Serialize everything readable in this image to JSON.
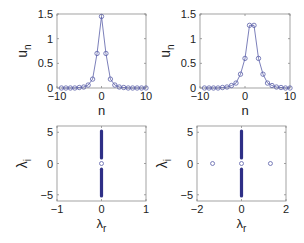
{
  "figure": {
    "background": "#ffffff",
    "line_color": "#5a5fa8",
    "marker_color": "#5a5fa8",
    "eig_color": "#2e2f86",
    "axis_color": "#8c8c8c"
  },
  "chart_data": [
    {
      "id": "top-left",
      "type": "line",
      "title": "",
      "xlabel": "n",
      "ylabel": "u",
      "ylabel_sub": "n",
      "xlim": [
        -10,
        10
      ],
      "ylim": [
        0,
        1.5
      ],
      "xticks": [
        "-10",
        "0",
        "10"
      ],
      "xtick_values": [
        -10,
        0,
        10
      ],
      "yticks": [
        "0",
        "0.5",
        "1",
        "1.5"
      ],
      "ytick_values": [
        0,
        0.5,
        1,
        1.5
      ],
      "grid": false,
      "frame": {
        "x0": 57,
        "x1": 146,
        "y0": 14,
        "y1": 88
      },
      "series": [
        {
          "name": "u_n",
          "marker": "circle-open",
          "x": [
            -9,
            -8,
            -7,
            -6,
            -5,
            -4,
            -3,
            -2,
            -1,
            0,
            1,
            2,
            3,
            4,
            5,
            6,
            7,
            8,
            9,
            10
          ],
          "values": [
            0.0,
            0.0,
            0.0,
            0.0,
            0.01,
            0.02,
            0.06,
            0.18,
            0.7,
            1.45,
            0.7,
            0.18,
            0.06,
            0.02,
            0.01,
            0.0,
            0.0,
            0.0,
            0.0,
            0.0
          ]
        }
      ]
    },
    {
      "id": "top-right",
      "type": "line",
      "title": "",
      "xlabel": "n",
      "ylabel": "u",
      "ylabel_sub": "n",
      "xlim": [
        -10,
        10
      ],
      "ylim": [
        0,
        1.5
      ],
      "xticks": [
        "-10",
        "0",
        "10"
      ],
      "xtick_values": [
        -10,
        0,
        10
      ],
      "yticks": [
        "0",
        "0.5",
        "1",
        "1.5"
      ],
      "ytick_values": [
        0,
        0.5,
        1,
        1.5
      ],
      "grid": false,
      "frame": {
        "x0": 200,
        "x1": 290,
        "y0": 14,
        "y1": 88
      },
      "series": [
        {
          "name": "u_n",
          "marker": "circle-open",
          "x": [
            -9,
            -8,
            -7,
            -6,
            -5,
            -4,
            -3,
            -2,
            -1,
            0,
            1,
            2,
            3,
            4,
            5,
            6,
            7,
            8,
            9,
            10
          ],
          "values": [
            0.0,
            0.0,
            0.0,
            0.0,
            0.01,
            0.02,
            0.05,
            0.1,
            0.28,
            0.6,
            1.27,
            1.27,
            0.6,
            0.28,
            0.1,
            0.05,
            0.02,
            0.01,
            0.0,
            0.0
          ]
        }
      ]
    },
    {
      "id": "bottom-left",
      "type": "scatter",
      "title": "",
      "xlabel": "λ",
      "xlabel_sub": "r",
      "ylabel": "λ",
      "ylabel_sub": "i",
      "xlim": [
        -1,
        1
      ],
      "ylim": [
        -6,
        6
      ],
      "xticks": [
        "-1",
        "0",
        "1"
      ],
      "xtick_values": [
        -1,
        0,
        1
      ],
      "yticks": [
        "-5",
        "0",
        "5"
      ],
      "ytick_values": [
        -5,
        0,
        5
      ],
      "grid": false,
      "frame": {
        "x0": 57,
        "x1": 146,
        "y0": 126,
        "y1": 201
      },
      "continuous_spectrum": [
        {
          "x": 0,
          "y_from": 0.9,
          "y_to": 5.2
        },
        {
          "x": 0,
          "y_from": -5.2,
          "y_to": -0.9
        }
      ],
      "points": [
        {
          "x": 0,
          "y": 0,
          "marker": "circle-open"
        }
      ]
    },
    {
      "id": "bottom-right",
      "type": "scatter",
      "title": "",
      "xlabel": "λ",
      "xlabel_sub": "r",
      "ylabel": "λ",
      "ylabel_sub": "i",
      "xlim": [
        -2,
        2
      ],
      "ylim": [
        -6,
        6
      ],
      "xticks": [
        "-2",
        "0",
        "2"
      ],
      "xtick_values": [
        -2,
        0,
        2
      ],
      "yticks": [
        "-5",
        "0",
        "5"
      ],
      "ytick_values": [
        -5,
        0,
        5
      ],
      "grid": false,
      "frame": {
        "x0": 197,
        "x1": 286,
        "y0": 126,
        "y1": 201
      },
      "continuous_spectrum": [
        {
          "x": 0,
          "y_from": 0.9,
          "y_to": 5.2
        },
        {
          "x": 0,
          "y_from": -5.2,
          "y_to": -0.9
        }
      ],
      "points": [
        {
          "x": -1.3,
          "y": 0,
          "marker": "circle-open"
        },
        {
          "x": 0,
          "y": 0,
          "marker": "circle-open"
        },
        {
          "x": 1.3,
          "y": 0,
          "marker": "circle-open"
        }
      ]
    }
  ]
}
